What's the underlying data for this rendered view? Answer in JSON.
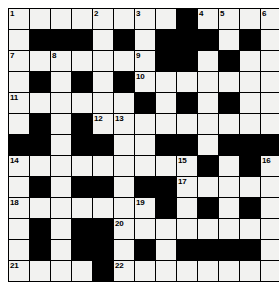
{
  "puzzle": {
    "type": "crossword-grid",
    "title": "Crossword Puzzle Grid",
    "columns": 13,
    "rows": 12,
    "colors": {
      "block": "#000000",
      "cell": "#f2f2f0",
      "grid_line": "#000000",
      "number_text": "#000000",
      "page_background": "#ffffff"
    },
    "legend": {
      "white_cell": "fillable-letter-square",
      "black_cell": "block-square"
    },
    "clue_numbers_present": [
      1,
      2,
      3,
      4,
      5,
      6,
      7,
      8,
      9,
      10,
      11,
      12,
      13,
      14,
      15,
      16,
      17,
      18,
      19,
      20,
      21,
      22
    ],
    "highest_clue_number": 22,
    "grid": [
      [
        {
          "t": "white",
          "n": "1"
        },
        {
          "t": "white",
          "n": ""
        },
        {
          "t": "white",
          "n": ""
        },
        {
          "t": "white",
          "n": ""
        },
        {
          "t": "white",
          "n": "2"
        },
        {
          "t": "white",
          "n": ""
        },
        {
          "t": "white",
          "n": "3"
        },
        {
          "t": "white",
          "n": ""
        },
        {
          "t": "black",
          "n": ""
        },
        {
          "t": "white",
          "n": "4"
        },
        {
          "t": "white",
          "n": "5"
        },
        {
          "t": "white",
          "n": ""
        },
        {
          "t": "white",
          "n": "6"
        }
      ],
      [
        {
          "t": "white",
          "n": ""
        },
        {
          "t": "black",
          "n": ""
        },
        {
          "t": "black",
          "n": ""
        },
        {
          "t": "black",
          "n": ""
        },
        {
          "t": "white",
          "n": ""
        },
        {
          "t": "black",
          "n": ""
        },
        {
          "t": "white",
          "n": ""
        },
        {
          "t": "black",
          "n": ""
        },
        {
          "t": "black",
          "n": ""
        },
        {
          "t": "black",
          "n": ""
        },
        {
          "t": "white",
          "n": ""
        },
        {
          "t": "black",
          "n": ""
        },
        {
          "t": "white",
          "n": ""
        }
      ],
      [
        {
          "t": "white",
          "n": "7"
        },
        {
          "t": "white",
          "n": ""
        },
        {
          "t": "white",
          "n": "8"
        },
        {
          "t": "white",
          "n": ""
        },
        {
          "t": "white",
          "n": ""
        },
        {
          "t": "white",
          "n": ""
        },
        {
          "t": "white",
          "n": "9"
        },
        {
          "t": "black",
          "n": ""
        },
        {
          "t": "black",
          "n": ""
        },
        {
          "t": "white",
          "n": ""
        },
        {
          "t": "black",
          "n": ""
        },
        {
          "t": "white",
          "n": ""
        },
        {
          "t": "white",
          "n": ""
        }
      ],
      [
        {
          "t": "white",
          "n": ""
        },
        {
          "t": "black",
          "n": ""
        },
        {
          "t": "white",
          "n": ""
        },
        {
          "t": "black",
          "n": ""
        },
        {
          "t": "white",
          "n": ""
        },
        {
          "t": "black",
          "n": ""
        },
        {
          "t": "white",
          "n": "10"
        },
        {
          "t": "white",
          "n": ""
        },
        {
          "t": "white",
          "n": ""
        },
        {
          "t": "white",
          "n": ""
        },
        {
          "t": "white",
          "n": ""
        },
        {
          "t": "white",
          "n": ""
        },
        {
          "t": "white",
          "n": ""
        }
      ],
      [
        {
          "t": "white",
          "n": "11"
        },
        {
          "t": "white",
          "n": ""
        },
        {
          "t": "white",
          "n": ""
        },
        {
          "t": "white",
          "n": ""
        },
        {
          "t": "white",
          "n": ""
        },
        {
          "t": "white",
          "n": ""
        },
        {
          "t": "black",
          "n": ""
        },
        {
          "t": "white",
          "n": ""
        },
        {
          "t": "black",
          "n": ""
        },
        {
          "t": "white",
          "n": ""
        },
        {
          "t": "black",
          "n": ""
        },
        {
          "t": "white",
          "n": ""
        },
        {
          "t": "white",
          "n": ""
        }
      ],
      [
        {
          "t": "white",
          "n": ""
        },
        {
          "t": "black",
          "n": ""
        },
        {
          "t": "white",
          "n": ""
        },
        {
          "t": "black",
          "n": ""
        },
        {
          "t": "white",
          "n": "12"
        },
        {
          "t": "white",
          "n": "13"
        },
        {
          "t": "white",
          "n": ""
        },
        {
          "t": "white",
          "n": ""
        },
        {
          "t": "white",
          "n": ""
        },
        {
          "t": "white",
          "n": ""
        },
        {
          "t": "white",
          "n": ""
        },
        {
          "t": "white",
          "n": ""
        },
        {
          "t": "white",
          "n": ""
        }
      ],
      [
        {
          "t": "black",
          "n": ""
        },
        {
          "t": "black",
          "n": ""
        },
        {
          "t": "white",
          "n": ""
        },
        {
          "t": "black",
          "n": ""
        },
        {
          "t": "black",
          "n": ""
        },
        {
          "t": "white",
          "n": ""
        },
        {
          "t": "white",
          "n": ""
        },
        {
          "t": "black",
          "n": ""
        },
        {
          "t": "black",
          "n": ""
        },
        {
          "t": "white",
          "n": ""
        },
        {
          "t": "black",
          "n": ""
        },
        {
          "t": "black",
          "n": ""
        },
        {
          "t": "black",
          "n": ""
        }
      ],
      [
        {
          "t": "white",
          "n": "14"
        },
        {
          "t": "white",
          "n": ""
        },
        {
          "t": "white",
          "n": ""
        },
        {
          "t": "white",
          "n": ""
        },
        {
          "t": "white",
          "n": ""
        },
        {
          "t": "white",
          "n": ""
        },
        {
          "t": "white",
          "n": ""
        },
        {
          "t": "white",
          "n": ""
        },
        {
          "t": "white",
          "n": "15"
        },
        {
          "t": "black",
          "n": ""
        },
        {
          "t": "white",
          "n": ""
        },
        {
          "t": "black",
          "n": ""
        },
        {
          "t": "white",
          "n": "16"
        }
      ],
      [
        {
          "t": "white",
          "n": ""
        },
        {
          "t": "black",
          "n": ""
        },
        {
          "t": "white",
          "n": ""
        },
        {
          "t": "black",
          "n": ""
        },
        {
          "t": "black",
          "n": ""
        },
        {
          "t": "white",
          "n": ""
        },
        {
          "t": "black",
          "n": ""
        },
        {
          "t": "black",
          "n": ""
        },
        {
          "t": "white",
          "n": "17"
        },
        {
          "t": "white",
          "n": ""
        },
        {
          "t": "white",
          "n": ""
        },
        {
          "t": "white",
          "n": ""
        },
        {
          "t": "white",
          "n": ""
        }
      ],
      [
        {
          "t": "white",
          "n": "18"
        },
        {
          "t": "white",
          "n": ""
        },
        {
          "t": "white",
          "n": ""
        },
        {
          "t": "white",
          "n": ""
        },
        {
          "t": "white",
          "n": ""
        },
        {
          "t": "white",
          "n": ""
        },
        {
          "t": "white",
          "n": "19"
        },
        {
          "t": "black",
          "n": ""
        },
        {
          "t": "white",
          "n": ""
        },
        {
          "t": "black",
          "n": ""
        },
        {
          "t": "white",
          "n": ""
        },
        {
          "t": "black",
          "n": ""
        },
        {
          "t": "white",
          "n": ""
        }
      ],
      [
        {
          "t": "white",
          "n": ""
        },
        {
          "t": "black",
          "n": ""
        },
        {
          "t": "white",
          "n": ""
        },
        {
          "t": "black",
          "n": ""
        },
        {
          "t": "black",
          "n": ""
        },
        {
          "t": "white",
          "n": "20"
        },
        {
          "t": "white",
          "n": ""
        },
        {
          "t": "white",
          "n": ""
        },
        {
          "t": "white",
          "n": ""
        },
        {
          "t": "white",
          "n": ""
        },
        {
          "t": "white",
          "n": ""
        },
        {
          "t": "white",
          "n": ""
        },
        {
          "t": "white",
          "n": ""
        }
      ],
      [
        {
          "t": "white",
          "n": ""
        },
        {
          "t": "black",
          "n": ""
        },
        {
          "t": "white",
          "n": ""
        },
        {
          "t": "black",
          "n": ""
        },
        {
          "t": "black",
          "n": ""
        },
        {
          "t": "white",
          "n": ""
        },
        {
          "t": "black",
          "n": ""
        },
        {
          "t": "white",
          "n": ""
        },
        {
          "t": "black",
          "n": ""
        },
        {
          "t": "black",
          "n": ""
        },
        {
          "t": "black",
          "n": ""
        },
        {
          "t": "black",
          "n": ""
        },
        {
          "t": "white",
          "n": ""
        }
      ],
      [
        {
          "t": "white",
          "n": "21"
        },
        {
          "t": "white",
          "n": ""
        },
        {
          "t": "white",
          "n": ""
        },
        {
          "t": "white",
          "n": ""
        },
        {
          "t": "black",
          "n": ""
        },
        {
          "t": "white",
          "n": "22"
        },
        {
          "t": "white",
          "n": ""
        },
        {
          "t": "white",
          "n": ""
        },
        {
          "t": "white",
          "n": ""
        },
        {
          "t": "white",
          "n": ""
        },
        {
          "t": "white",
          "n": ""
        },
        {
          "t": "white",
          "n": ""
        },
        {
          "t": "white",
          "n": ""
        }
      ]
    ]
  }
}
